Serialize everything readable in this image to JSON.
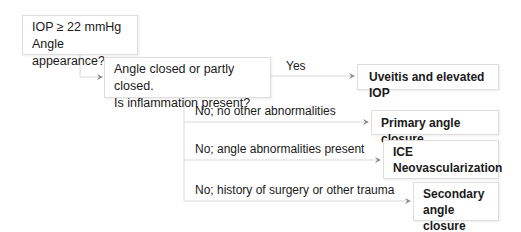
{
  "diagram": {
    "start": {
      "line1": "IOP ≥ 22 mmHg",
      "line2": "Angle appearance?"
    },
    "question": {
      "line1": "Angle closed or partly closed.",
      "line2": "Is inflammation present?"
    },
    "branches": [
      {
        "label": "Yes",
        "outcome_lines": [
          "Uveitis and elevated IOP"
        ]
      },
      {
        "label": "No; no other abnormalities",
        "outcome_lines": [
          "Primary angle closure"
        ]
      },
      {
        "label": "No; angle abnormalities present",
        "outcome_lines": [
          "ICE",
          "Neovascularization"
        ]
      },
      {
        "label": "No; history of surgery or other trauma",
        "outcome_lines": [
          "Secondary",
          "angle closure"
        ]
      }
    ],
    "colors": {
      "connector": "#d9d9d9",
      "arrowhead": "#8c8c8c",
      "box_border": "#dedede",
      "text": "#1a1a1a"
    }
  }
}
